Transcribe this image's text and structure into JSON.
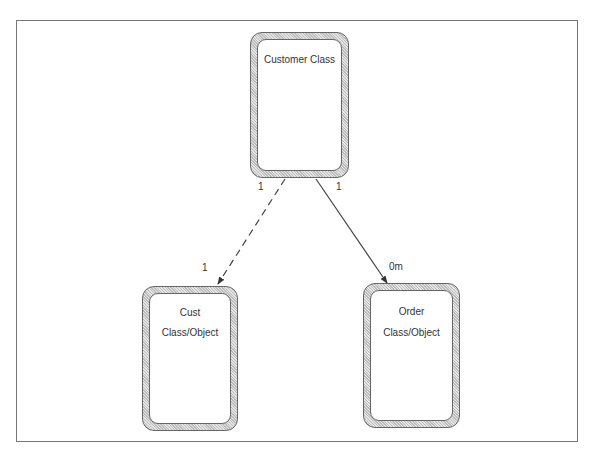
{
  "diagram": {
    "classes": [
      {
        "id": "customer",
        "lines": [
          "Customer Class"
        ]
      },
      {
        "id": "cust",
        "lines": [
          "Cust",
          "Class/Object"
        ]
      },
      {
        "id": "order",
        "lines": [
          "Order",
          "Class/Object"
        ]
      }
    ],
    "associations": [
      {
        "from": "customer",
        "to": "cust",
        "style": "dashed",
        "from_mult": "1",
        "to_mult": "1"
      },
      {
        "from": "customer",
        "to": "order",
        "style": "solid",
        "from_mult": "1",
        "to_mult": "0m"
      }
    ]
  }
}
